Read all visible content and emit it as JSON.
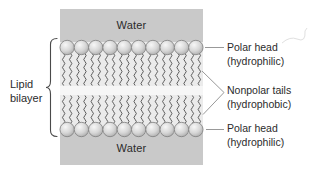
{
  "figure": {
    "labels": {
      "water_top": "Water",
      "water_bottom": "Water",
      "lipid_bilayer": "Lipid bilayer",
      "polar_head_top": {
        "line1": "Polar head",
        "line2": "(hydrophilic)"
      },
      "nonpolar_tails": {
        "line1": "Nonpolar tails",
        "line2": "(hydrophobic)"
      },
      "polar_head_bottom": {
        "line1": "Polar head",
        "line2": "(hydrophilic)"
      }
    },
    "membrane": {
      "heads_per_row": 10,
      "rows": 2,
      "tails_per_head": 2
    },
    "colors": {
      "water_band": "#c9c9c9",
      "membrane_interior": "#ebebeb",
      "interior_gap": "#f6f6f6",
      "head_fill_light": "#f7f7f7",
      "head_fill_mid": "#d6d6d6",
      "head_fill_dark": "#a6a6a6",
      "head_outline": "#7d7d7d",
      "tail_stroke": "#4c4c4c",
      "leader_line": "#999999",
      "bracket": "#4a4a4a",
      "text": "#2b2b2b",
      "pen_mark": "#e0e0e0"
    }
  }
}
